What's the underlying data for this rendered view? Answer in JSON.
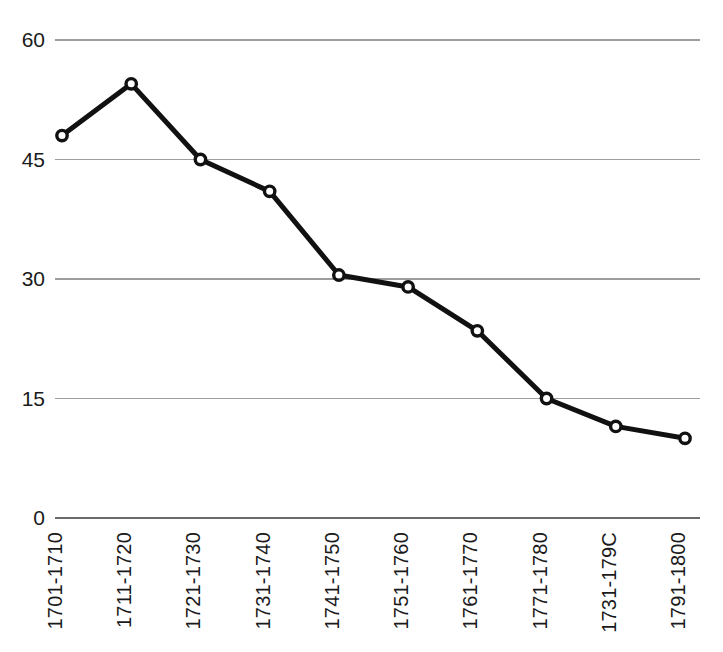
{
  "chart_data": {
    "type": "line",
    "title": "",
    "subtitle": "",
    "xlabel": "",
    "ylabel": "",
    "categories": [
      "1701-1710",
      "1711-1720",
      "1721-1730",
      "1731-1740",
      "1741-1750",
      "1751-1760",
      "1761-1770",
      "1771-1780",
      "1731-179C",
      "1791-1800"
    ],
    "values": [
      48,
      54.5,
      45,
      41,
      30.5,
      29,
      23.5,
      15,
      11.5,
      10
    ],
    "ylim": [
      0,
      60
    ],
    "yticks": [
      0,
      15,
      30,
      45,
      60
    ],
    "ytick_labels": [
      "0",
      "15",
      "30",
      "45",
      "60"
    ],
    "grid": true,
    "grid_axis": "y",
    "legend": false,
    "legend_position": "none",
    "marker": "open-circle",
    "line_color": "#111111",
    "marker_fill": "#ffffff",
    "gridline_color": "#9d9d9d",
    "axis_color": "#6a6a6a",
    "background_color": "#ffffff",
    "xtick_rotation": -90
  }
}
